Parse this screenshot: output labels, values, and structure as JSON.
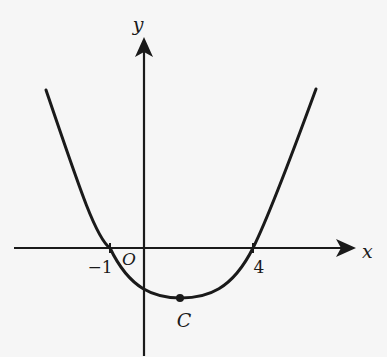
{
  "diagram": {
    "type": "parabola-graph",
    "equation_form": "y = a(x + 1)(x - 4)",
    "colors": {
      "background": "#f6f6f6",
      "ink": "#1a1a1a"
    },
    "axes": {
      "x_label": "x",
      "y_label": "y",
      "origin_label": "O"
    },
    "x_intercepts": [
      {
        "value": -1,
        "label": "-1"
      },
      {
        "value": 4,
        "label": "4"
      }
    ],
    "vertex": {
      "label": "C",
      "x": 1.5
    },
    "labels": {
      "x_axis": "x",
      "y_axis": "y",
      "origin": "O",
      "root_left": "−1",
      "root_right": "4",
      "vertex": "C"
    }
  }
}
